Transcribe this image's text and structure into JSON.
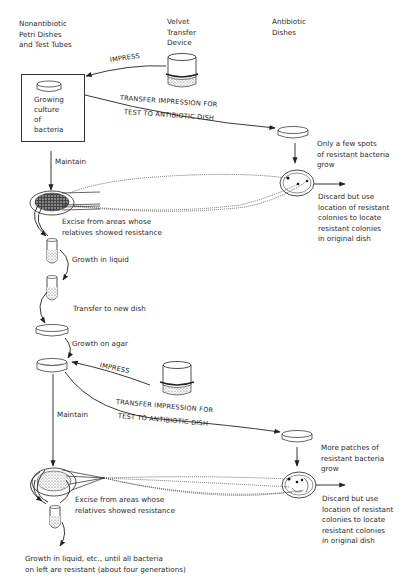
{
  "headers": {
    "left": "Nonantibiotic\nPetri Dishes\nand Test Tubes",
    "middle": "Velvet\nTransfer\nDevice",
    "right": "Antibiotic\nDishes"
  },
  "cycle1": {
    "impress": "IMPRESS",
    "culture_box": "Growing\nculture\nof\nbacteria",
    "transfer_line1": "TRANSFER IMPRESSION FOR",
    "transfer_line2": "TEST TO ANTIBIOTIC DISH",
    "result_note": "Only a few spots\nof resistant bacteria\ngrow",
    "discard_note": "Discard but use\nlocation of resistant\ncolonies to locate\nresistant colonies\nin original dish",
    "maintain": "Maintain",
    "excise": "Excise from areas whose\nrelatives showed resistance"
  },
  "steps": {
    "growth_liquid": "Growth in liquid",
    "transfer_new_dish": "Transfer to new dish",
    "growth_agar": "Growth on agar"
  },
  "cycle2": {
    "impress": "IMPRESS",
    "transfer_line1": "TRANSFER IMPRESSION FOR",
    "transfer_line2": "TEST TO ANTIBIOTIC DISH",
    "result_note": "More patches of\nresistant bacteria\ngrow",
    "discard_note": "Discard but use\nlocation of resistant\ncolonies to locate\nresistant colonies\nin original dish",
    "maintain": "Maintain",
    "excise": "Excise from areas whose\nrelatives showed resistance"
  },
  "footer": {
    "final_note": "Growth in liquid, etc., until all bacteria\non left are resistant (about four generations)"
  }
}
